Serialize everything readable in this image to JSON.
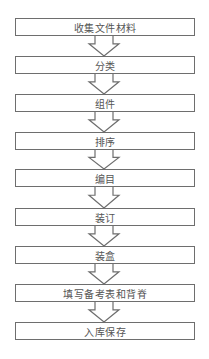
{
  "flowchart": {
    "steps": [
      {
        "label": "收集文件材料",
        "top": 18
      },
      {
        "label": "分类",
        "top": 56
      },
      {
        "label": "组件",
        "top": 94
      },
      {
        "label": "排序",
        "top": 132
      },
      {
        "label": "编目",
        "top": 169
      },
      {
        "label": "装订",
        "top": 208
      },
      {
        "label": "装盒",
        "top": 246
      },
      {
        "label": "填写备考表和背脊",
        "top": 284
      },
      {
        "label": "入库保存",
        "top": 322
      }
    ],
    "connector": "hollow-down-arrow",
    "border_color": "#6e6e6e",
    "text_color": "#555555"
  }
}
